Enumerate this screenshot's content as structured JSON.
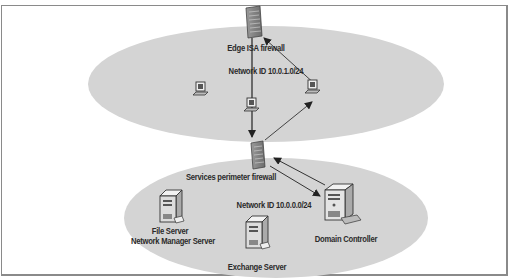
{
  "diagram": {
    "type": "network-topology",
    "zones": [
      {
        "id": "perimeter",
        "network_id_label": "Network ID 10.0.1.0/24"
      },
      {
        "id": "services",
        "network_id_label": "Network ID 10.0.0.0/24"
      }
    ],
    "nodes": {
      "edge_firewall": {
        "label": "Edge ISA firewall",
        "icon": "firewall-icon"
      },
      "services_firewall": {
        "label": "Services perimeter firewall",
        "icon": "firewall-icon"
      },
      "workstation_left": {
        "icon": "workstation-icon"
      },
      "workstation_center": {
        "icon": "workstation-icon"
      },
      "workstation_right": {
        "icon": "workstation-icon"
      },
      "file_server": {
        "label_line1": "File Server",
        "label_line2": "Network Manager Server",
        "icon": "server-icon"
      },
      "exchange_server": {
        "label": "Exchange Server",
        "icon": "server-icon"
      },
      "domain_controller": {
        "label": "Domain Controller",
        "icon": "server-icon"
      }
    },
    "connections": [
      {
        "from": "edge_firewall",
        "to": "services_firewall",
        "direction": "down"
      },
      {
        "from": "services_firewall",
        "to": "workstation_right",
        "direction": "up"
      },
      {
        "from": "workstation_right",
        "to": "edge_firewall",
        "direction": "up"
      },
      {
        "from": "domain_controller",
        "to": "services_firewall",
        "direction": "to-firewall"
      },
      {
        "from": "services_firewall",
        "to": "domain_controller",
        "direction": "to-dc"
      }
    ],
    "colors": {
      "zone_fill": "#d4d4d4",
      "line": "#333333",
      "border": "#8a8a8a"
    }
  }
}
